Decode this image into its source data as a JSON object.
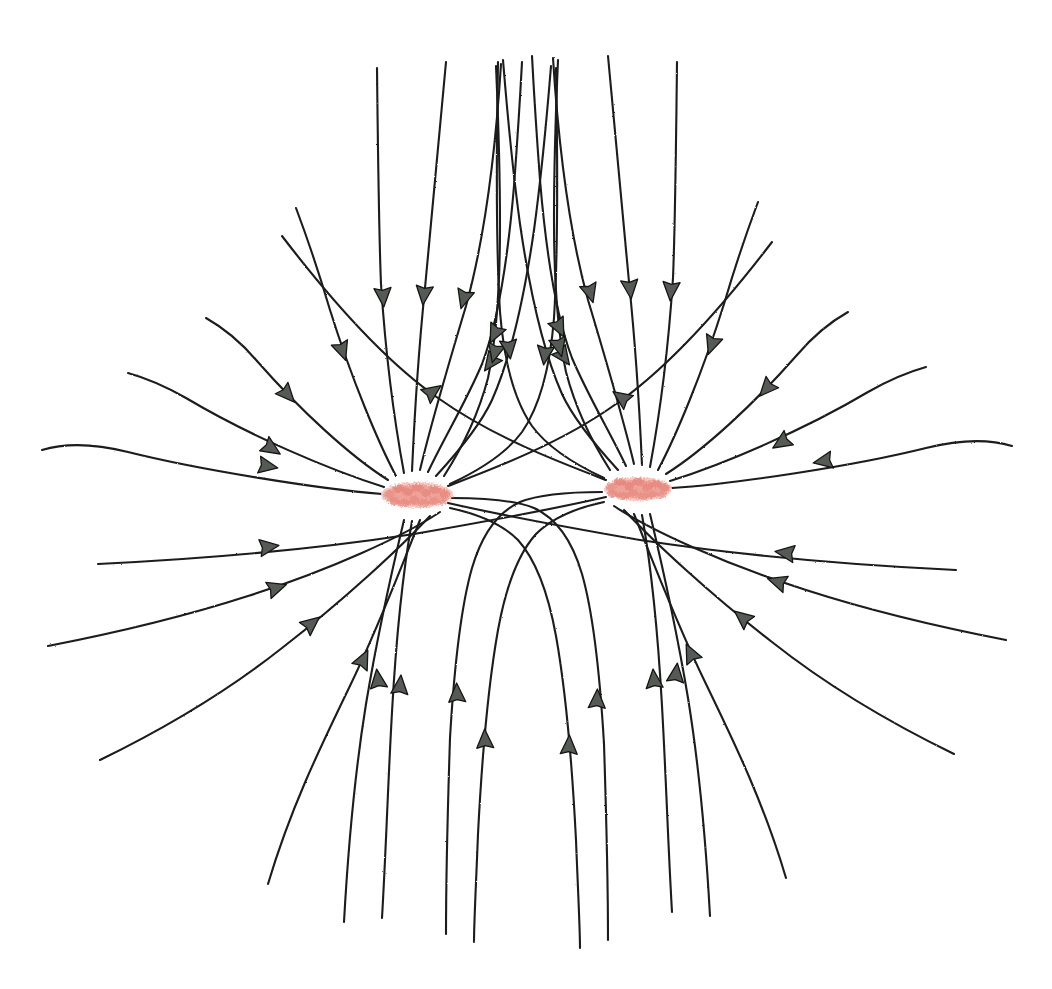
{
  "figure": {
    "medium": "hand-drawn pencil sketch on white paper",
    "background_color": "#ffffff",
    "line_color": "#1b1b1b",
    "arrow_fill_color": "#555a55",
    "charge_color": "#efa298",
    "width": 1052,
    "height": 989
  },
  "chart_data": {
    "type": "line",
    "subtitle": "",
    "xlabel": "",
    "ylabel": "",
    "grid": false,
    "legend": "none",
    "xlim": [
      0,
      1052
    ],
    "ylim": [
      0,
      989
    ],
    "field_direction": "inward",
    "charge_sign": "negative",
    "charge_count": 2,
    "lines_per_charge": 16,
    "neutral_point_x": 526,
    "neutral_point_y": 495,
    "charges": [
      {
        "id": "charge-left",
        "label": "",
        "sign": "negative",
        "cx": 417,
        "cy": 495,
        "rx": 36,
        "ry": 13,
        "color": "#efa298"
      },
      {
        "id": "charge-right",
        "label": "",
        "sign": "negative",
        "cx": 638,
        "cy": 489,
        "rx": 34,
        "ry": 12,
        "color": "#efa298"
      }
    ],
    "series": [
      {
        "name": "left-charge-field-lines",
        "charge": "charge-left",
        "count": 16,
        "angles_deg": [
          168,
          152,
          133,
          113,
          100,
          92,
          84,
          74,
          62,
          28,
          352,
          330,
          312,
          295,
          280,
          264
        ]
      },
      {
        "name": "right-charge-field-lines",
        "charge": "charge-right",
        "count": 16,
        "angles_deg": [
          12,
          28,
          47,
          67,
          80,
          88,
          96,
          106,
          118,
          152,
          188,
          210,
          228,
          245,
          260,
          276
        ]
      }
    ],
    "annotations": []
  },
  "left_lines": [
    {
      "id": "L-w1",
      "d": "M 382 494 C 320 489 200 470 128 452 C 100 445 68 442 42 450",
      "arrow": {
        "x": 267,
        "y": 466,
        "angle": 10
      },
      "tip_scale": 1.0
    },
    {
      "id": "L-w2",
      "d": "M 384 487 C 330 470 250 436 186 398 C 165 386 146 378 128 373",
      "arrow": {
        "x": 271,
        "y": 448,
        "angle": 33
      },
      "tip_scale": 1.0
    },
    {
      "id": "L-w3",
      "d": "M 388 480 C 350 456 300 410 257 361 C 240 341 222 327 206 318",
      "arrow": {
        "x": 287,
        "y": 394,
        "angle": 48
      },
      "tip_scale": 1.0
    },
    {
      "id": "L-w4",
      "d": "M 396 476 C 378 442 352 380 330 310 C 320 276 308 240 296 208",
      "arrow": {
        "x": 342,
        "y": 350,
        "angle": 71
      },
      "tip_scale": 1.0
    },
    {
      "id": "L-w5",
      "d": "M 404 473 C 396 430 386 360 381 284 C 379 235 378 160 377 68",
      "arrow": {
        "x": 383,
        "y": 296,
        "angle": 86
      },
      "tip_scale": 1.0
    },
    {
      "id": "L-w6",
      "d": "M 412 471 C 414 426 418 356 425 288 C 431 224 438 152 446 62",
      "arrow": {
        "x": 424,
        "y": 294,
        "angle": 96
      },
      "tip_scale": 1.0
    },
    {
      "id": "L-w7",
      "d": "M 420 470 C 430 428 448 366 466 306 C 482 248 494 176 501 64",
      "arrow": {
        "x": 464,
        "y": 298,
        "angle": 106
      },
      "tip_scale": 1.0
    },
    {
      "id": "L-w8",
      "d": "M 428 472 C 444 438 466 402 482 364 C 498 322 508 258 514 186 C 517 146 520 100 522 62",
      "arrow": {
        "x": 495,
        "y": 333,
        "angle": 116
      },
      "tip_scale": 1.0
    },
    {
      "id": "L-w9",
      "d": "M 436 476 C 458 452 480 426 492 400 C 508 364 523 306 534 230 C 540 186 546 128 551 66",
      "arrow": {
        "x": 491,
        "y": 362,
        "angle": 126
      },
      "tip_scale": 1.0
    },
    {
      "id": "L-w10",
      "d": "M 448 486 C 490 470 560 444 616 404 C 668 368 720 310 772 242",
      "arrow": {
        "x": 622,
        "y": 398,
        "angle": 215
      },
      "tip_scale": 1.0
    },
    {
      "id": "L-w11",
      "d": "M 448 503 C 492 513 565 527 640 540 C 718 552 830 564 956 570",
      "arrow": {
        "x": 786,
        "y": 553,
        "angle": 188
      },
      "tip_scale": 1.0
    },
    {
      "id": "L-w12",
      "d": "M 440 512 C 404 536 330 570 248 596 C 186 616 120 632 48 646",
      "arrow": {
        "x": 276,
        "y": 588,
        "angle": 342
      },
      "tip_scale": 1.0
    },
    {
      "id": "L-w13",
      "d": "M 430 516 C 400 548 344 600 282 648 C 234 686 174 724 100 760",
      "arrow": {
        "x": 311,
        "y": 624,
        "angle": 321
      },
      "tip_scale": 1.0
    },
    {
      "id": "L-w14",
      "d": "M 420 520 C 404 560 380 624 348 690 C 318 752 290 810 268 884",
      "arrow": {
        "x": 363,
        "y": 660,
        "angle": 296
      },
      "tip_scale": 1.0
    },
    {
      "id": "L-w15",
      "d": "M 412 521 C 404 566 396 640 392 712 C 388 782 386 850 382 918",
      "arrow": {
        "x": 400,
        "y": 686,
        "angle": 275
      },
      "tip_scale": 1.0
    },
    {
      "id": "L-w16",
      "d": "M 404 520 C 394 562 378 632 366 704 C 354 778 348 850 344 922",
      "arrow": {
        "x": 378,
        "y": 680,
        "angle": 263
      },
      "tip_scale": 1.0
    }
  ],
  "left_inner_lines": [
    {
      "id": "L-i1",
      "d": "M 444 476 C 462 448 478 416 488 378 C 496 340 500 288 500 226 C 500 168 498 112 496 66",
      "arrow": {
        "x": 495,
        "y": 352,
        "angle": 104
      },
      "tip_scale": 1.0
    },
    {
      "id": "L-i2",
      "d": "M 450 484 C 480 470 506 454 522 432 C 540 406 550 368 554 318 C 558 254 558 178 556 68",
      "arrow": {
        "x": 545,
        "y": 354,
        "angle": 97
      },
      "tip_scale": 1.0
    },
    {
      "id": "L-i3",
      "d": "M 452 498 C 484 498 514 500 534 508 C 556 518 572 540 582 574 C 594 616 600 676 604 744 C 606 806 608 868 608 940",
      "arrow": {
        "x": 597,
        "y": 700,
        "angle": 272
      },
      "tip_scale": 1.0
    },
    {
      "id": "L-i4",
      "d": "M 450 508 C 478 514 502 524 518 540 C 536 560 548 592 556 636 C 566 692 572 762 576 840 C 578 892 580 928 580 948",
      "arrow": {
        "x": 569,
        "y": 746,
        "angle": 272
      },
      "tip_scale": 1.0
    }
  ],
  "right_lines": [
    {
      "id": "R-w1",
      "d": "M 672 488 C 734 484 854 466 926 448 C 954 441 986 438 1012 446",
      "arrow": {
        "x": 824,
        "y": 461,
        "angle": 170
      },
      "tip_scale": 1.0
    },
    {
      "id": "R-w2",
      "d": "M 670 481 C 724 464 804 430 868 392 C 889 380 908 372 926 367",
      "arrow": {
        "x": 782,
        "y": 442,
        "angle": 147
      },
      "tip_scale": 1.0
    },
    {
      "id": "R-w3",
      "d": "M 666 474 C 704 450 754 404 797 355 C 814 335 832 321 848 312",
      "arrow": {
        "x": 767,
        "y": 388,
        "angle": 132
      },
      "tip_scale": 1.0
    },
    {
      "id": "R-w4",
      "d": "M 658 470 C 676 436 702 374 724 304 C 734 270 746 234 758 202",
      "arrow": {
        "x": 712,
        "y": 344,
        "angle": 109
      },
      "tip_scale": 1.0
    },
    {
      "id": "R-w5",
      "d": "M 650 467 C 658 424 668 354 673 278 C 675 229 676 154 677 62",
      "arrow": {
        "x": 671,
        "y": 290,
        "angle": 94
      },
      "tip_scale": 1.0
    },
    {
      "id": "R-w6",
      "d": "M 642 465 C 640 420 636 350 629 282 C 623 218 616 146 608 56",
      "arrow": {
        "x": 630,
        "y": 288,
        "angle": 84
      },
      "tip_scale": 1.0
    },
    {
      "id": "R-w7",
      "d": "M 634 464 C 624 422 606 360 588 300 C 572 242 560 170 553 58",
      "arrow": {
        "x": 590,
        "y": 292,
        "angle": 74
      },
      "tip_scale": 1.0
    },
    {
      "id": "R-w8",
      "d": "M 626 466 C 610 432 588 396 572 358 C 556 316 546 252 540 180 C 537 140 534 94 532 56",
      "arrow": {
        "x": 559,
        "y": 327,
        "angle": 64
      },
      "tip_scale": 1.0
    },
    {
      "id": "R-w9",
      "d": "M 618 470 C 596 446 574 420 562 394 C 546 358 531 300 520 224 C 514 180 508 122 503 60",
      "arrow": {
        "x": 563,
        "y": 356,
        "angle": 54
      },
      "tip_scale": 1.0
    },
    {
      "id": "R-w10",
      "d": "M 606 480 C 564 464 494 438 438 398 C 386 362 334 304 282 236",
      "arrow": {
        "x": 432,
        "y": 392,
        "angle": 325
      },
      "tip_scale": 1.0
    },
    {
      "id": "R-w11",
      "d": "M 606 497 C 562 507 489 521 414 534 C 336 546 224 558 98 564",
      "arrow": {
        "x": 268,
        "y": 547,
        "angle": 352
      },
      "tip_scale": 1.0
    },
    {
      "id": "R-w12",
      "d": "M 614 506 C 650 530 724 564 806 590 C 868 610 934 626 1006 640",
      "arrow": {
        "x": 778,
        "y": 582,
        "angle": 198
      },
      "tip_scale": 1.0
    },
    {
      "id": "R-w13",
      "d": "M 624 510 C 654 542 710 594 772 642 C 820 680 880 718 954 754",
      "arrow": {
        "x": 743,
        "y": 618,
        "angle": 219
      },
      "tip_scale": 1.0
    },
    {
      "id": "R-w14",
      "d": "M 634 514 C 650 554 674 618 706 684 C 736 746 764 804 786 878",
      "arrow": {
        "x": 691,
        "y": 654,
        "angle": 244
      },
      "tip_scale": 1.0
    },
    {
      "id": "R-w15",
      "d": "M 642 515 C 650 560 658 634 662 706 C 666 776 668 844 672 912",
      "arrow": {
        "x": 654,
        "y": 680,
        "angle": 265
      },
      "tip_scale": 1.0
    },
    {
      "id": "R-w16",
      "d": "M 650 514 C 660 556 676 626 688 698 C 700 772 706 844 710 916",
      "arrow": {
        "x": 676,
        "y": 674,
        "angle": 277
      },
      "tip_scale": 1.0
    }
  ],
  "right_inner_lines": [
    {
      "id": "R-i1",
      "d": "M 610 470 C 592 442 576 410 566 372 C 558 334 554 282 554 220 C 554 162 556 106 558 60",
      "arrow": {
        "x": 559,
        "y": 346,
        "angle": 76
      },
      "tip_scale": 1.0
    },
    {
      "id": "R-i2",
      "d": "M 604 478 C 574 464 548 448 532 426 C 514 400 504 362 500 312 C 496 248 496 172 498 62",
      "arrow": {
        "x": 509,
        "y": 348,
        "angle": 83
      },
      "tip_scale": 1.0
    },
    {
      "id": "R-i3",
      "d": "M 602 492 C 570 492 540 494 520 502 C 498 512 482 534 472 568 C 460 610 454 670 450 738 C 448 800 446 862 446 934",
      "arrow": {
        "x": 457,
        "y": 694,
        "angle": 268
      },
      "tip_scale": 1.0
    },
    {
      "id": "R-i4",
      "d": "M 604 502 C 576 508 552 518 536 534 C 518 554 506 586 498 630 C 488 686 482 756 478 834 C 476 886 474 922 474 942",
      "arrow": {
        "x": 485,
        "y": 740,
        "angle": 268
      },
      "tip_scale": 1.0
    }
  ],
  "left_charge_speckles": [
    {
      "cx": 390,
      "cy": 494,
      "rx": 5,
      "ry": 4
    },
    {
      "cx": 399,
      "cy": 489,
      "rx": 6,
      "ry": 4
    },
    {
      "cx": 408,
      "cy": 492,
      "rx": 5,
      "ry": 4
    },
    {
      "cx": 417,
      "cy": 488,
      "rx": 6,
      "ry": 4
    },
    {
      "cx": 426,
      "cy": 493,
      "rx": 5,
      "ry": 4
    },
    {
      "cx": 435,
      "cy": 490,
      "rx": 6,
      "ry": 4
    },
    {
      "cx": 444,
      "cy": 494,
      "rx": 5,
      "ry": 4
    },
    {
      "cx": 394,
      "cy": 501,
      "rx": 5,
      "ry": 4
    },
    {
      "cx": 404,
      "cy": 503,
      "rx": 6,
      "ry": 4
    },
    {
      "cx": 414,
      "cy": 500,
      "rx": 5,
      "ry": 4
    },
    {
      "cx": 424,
      "cy": 503,
      "rx": 6,
      "ry": 4
    },
    {
      "cx": 434,
      "cy": 501,
      "rx": 5,
      "ry": 4
    },
    {
      "cx": 443,
      "cy": 502,
      "rx": 4,
      "ry": 3
    }
  ],
  "right_charge_speckles": [
    {
      "cx": 611,
      "cy": 487,
      "rx": 5,
      "ry": 4
    },
    {
      "cx": 620,
      "cy": 482,
      "rx": 6,
      "ry": 4
    },
    {
      "cx": 629,
      "cy": 486,
      "rx": 5,
      "ry": 4
    },
    {
      "cx": 638,
      "cy": 482,
      "rx": 6,
      "ry": 4
    },
    {
      "cx": 647,
      "cy": 487,
      "rx": 5,
      "ry": 4
    },
    {
      "cx": 656,
      "cy": 484,
      "rx": 6,
      "ry": 4
    },
    {
      "cx": 664,
      "cy": 488,
      "rx": 5,
      "ry": 4
    },
    {
      "cx": 613,
      "cy": 494,
      "rx": 5,
      "ry": 4
    },
    {
      "cx": 623,
      "cy": 496,
      "rx": 6,
      "ry": 4
    },
    {
      "cx": 633,
      "cy": 493,
      "rx": 5,
      "ry": 4
    },
    {
      "cx": 643,
      "cy": 496,
      "rx": 6,
      "ry": 4
    },
    {
      "cx": 653,
      "cy": 494,
      "rx": 5,
      "ry": 4
    },
    {
      "cx": 662,
      "cy": 495,
      "rx": 4,
      "ry": 3
    }
  ]
}
